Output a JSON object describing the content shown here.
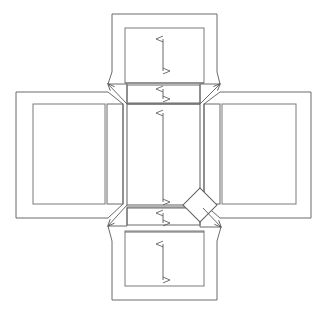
{
  "document": {
    "title": "Cruciform Unfolded Net Diagram",
    "type": "technical-line-drawing",
    "width": 327,
    "height": 314,
    "background_color": "#ffffff"
  },
  "style": {
    "stroke_color": "#6b6b6b",
    "stroke_color_dark": "#4a4a4a",
    "stroke_width_outer": 1.0,
    "stroke_width_inner": 1.0,
    "arrow_color": "#5a5a5a",
    "arrow_stroke_width": 0.9,
    "fill": "none"
  },
  "panels": [
    {
      "name": "top-panel",
      "label": "top flap",
      "outer": {
        "x": 112,
        "y": 14,
        "width": 105,
        "height": 73
      },
      "inner": {
        "x": 125,
        "y": 28,
        "width": 79,
        "height": 55
      },
      "has_dimension_arrow": true
    },
    {
      "name": "top-strip",
      "label": "top hinge strip",
      "outer": {
        "x": 127,
        "y": 85,
        "width": 73,
        "height": 18
      },
      "inner": null,
      "has_dimension_arrow": true
    },
    {
      "name": "left-panel",
      "label": "left flap",
      "outer": {
        "x": 16,
        "y": 92,
        "width": 97,
        "height": 126
      },
      "inner": {
        "x": 33,
        "y": 104,
        "width": 72,
        "height": 100
      },
      "has_dimension_arrow": false
    },
    {
      "name": "left-strip",
      "label": "left hinge strip",
      "outer": {
        "x": 107,
        "y": 104,
        "width": 16,
        "height": 100
      },
      "inner": null,
      "has_dimension_arrow": false
    },
    {
      "name": "center-panel",
      "label": "base panel",
      "outer": {
        "x": 127,
        "y": 104,
        "width": 73,
        "height": 101
      },
      "inner": null,
      "has_dimension_arrow": true
    },
    {
      "name": "right-strip",
      "label": "right hinge strip",
      "outer": {
        "x": 204,
        "y": 104,
        "width": 16,
        "height": 100
      },
      "inner": null,
      "has_dimension_arrow": false
    },
    {
      "name": "right-panel",
      "label": "right flap",
      "outer": {
        "x": 214,
        "y": 92,
        "width": 97,
        "height": 126
      },
      "inner": {
        "x": 222,
        "y": 104,
        "width": 74,
        "height": 100
      },
      "has_dimension_arrow": false
    },
    {
      "name": "bottom-strip",
      "label": "bottom hinge strip",
      "outer": {
        "x": 127,
        "y": 207,
        "width": 73,
        "height": 18
      },
      "inner": null,
      "has_dimension_arrow": true
    },
    {
      "name": "bottom-panel",
      "label": "bottom flap",
      "outer": {
        "x": 112,
        "y": 226,
        "width": 105,
        "height": 74
      },
      "inner": {
        "x": 125,
        "y": 231,
        "width": 79,
        "height": 55
      },
      "has_dimension_arrow": true
    }
  ],
  "dimension_arrows": [
    {
      "name": "top-panel-height-arrow",
      "x": 163,
      "y1": 38,
      "y2": 72,
      "double_headed": true
    },
    {
      "name": "top-strip-height-arrow",
      "x": 163,
      "y1": 88,
      "y2": 100,
      "double_headed": true
    },
    {
      "name": "center-panel-height-arrow",
      "x": 163,
      "y1": 112,
      "y2": 203,
      "double_headed": true
    },
    {
      "name": "bottom-strip-height-arrow",
      "x": 163,
      "y1": 212,
      "y2": 224,
      "double_headed": true
    },
    {
      "name": "bottom-panel-height-arrow",
      "x": 163,
      "y1": 243,
      "y2": 281,
      "double_headed": true
    }
  ],
  "corner_leaders": [
    {
      "name": "leader-top-left",
      "x1": 127,
      "y1": 104,
      "x2": 108,
      "y2": 84,
      "arrow_at": "end",
      "direction": "up-left"
    },
    {
      "name": "leader-top-right",
      "x1": 200,
      "y1": 104,
      "x2": 220,
      "y2": 84,
      "arrow_at": "end",
      "direction": "up-right"
    },
    {
      "name": "leader-bottom-left",
      "x1": 127,
      "y1": 205,
      "x2": 108,
      "y2": 226,
      "arrow_at": "end",
      "direction": "down-left"
    },
    {
      "name": "leader-bottom-right",
      "x1": 203,
      "y1": 208,
      "x2": 221,
      "y2": 227,
      "arrow_at": "end",
      "direction": "down-right"
    }
  ],
  "diamond_marker": {
    "name": "corner-diamond-marker",
    "center_x": 200,
    "center_y": 205,
    "half_size": 12,
    "rotation_deg": 45
  },
  "connector_edges": [
    {
      "name": "top-panel-left-bevel",
      "x1": 112,
      "y1": 14,
      "x2": 127,
      "y2": 85
    },
    {
      "name": "top-panel-right-bevel",
      "x1": 217,
      "y1": 14,
      "x2": 200,
      "y2": 85
    },
    {
      "name": "bottom-panel-left-bevel",
      "x1": 112,
      "y1": 300,
      "x2": 127,
      "y2": 225
    },
    {
      "name": "bottom-panel-right-bevel",
      "x1": 217,
      "y1": 300,
      "x2": 200,
      "y2": 225
    }
  ],
  "legend": {
    "visible": false,
    "items": []
  },
  "annotations": {
    "text_labels": []
  }
}
